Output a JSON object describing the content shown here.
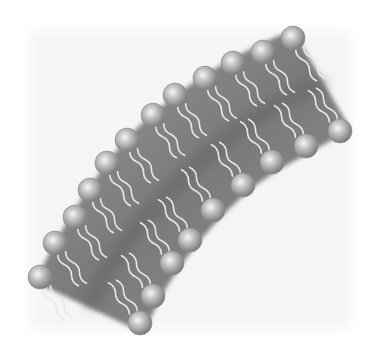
{
  "diagram": {
    "colors": {
      "background": "#ffffff",
      "haze": "#f1f1f1",
      "membrane": "#8a8a8a",
      "membrane_core": "#6e6e6e",
      "tail": "#e6e6e6",
      "head_light": "#f4f4f4",
      "head_mid": "#b8b8b8",
      "head_dark": "#7a7a7a"
    },
    "outer_heads": [
      [
        293,
        38
      ],
      [
        263,
        52
      ],
      [
        233,
        63
      ],
      [
        205,
        78
      ],
      [
        175,
        95
      ],
      [
        153,
        115
      ],
      [
        127,
        140
      ],
      [
        107,
        163
      ],
      [
        90,
        190
      ],
      [
        75,
        217
      ],
      [
        55,
        243
      ],
      [
        40,
        277
      ]
    ],
    "inner_heads": [
      [
        340,
        131
      ],
      [
        306,
        146
      ],
      [
        272,
        162
      ],
      [
        243,
        185
      ],
      [
        213,
        210
      ],
      [
        190,
        240
      ],
      [
        172,
        263
      ],
      [
        153,
        296
      ],
      [
        140,
        323
      ]
    ],
    "head_radius": 12
  }
}
